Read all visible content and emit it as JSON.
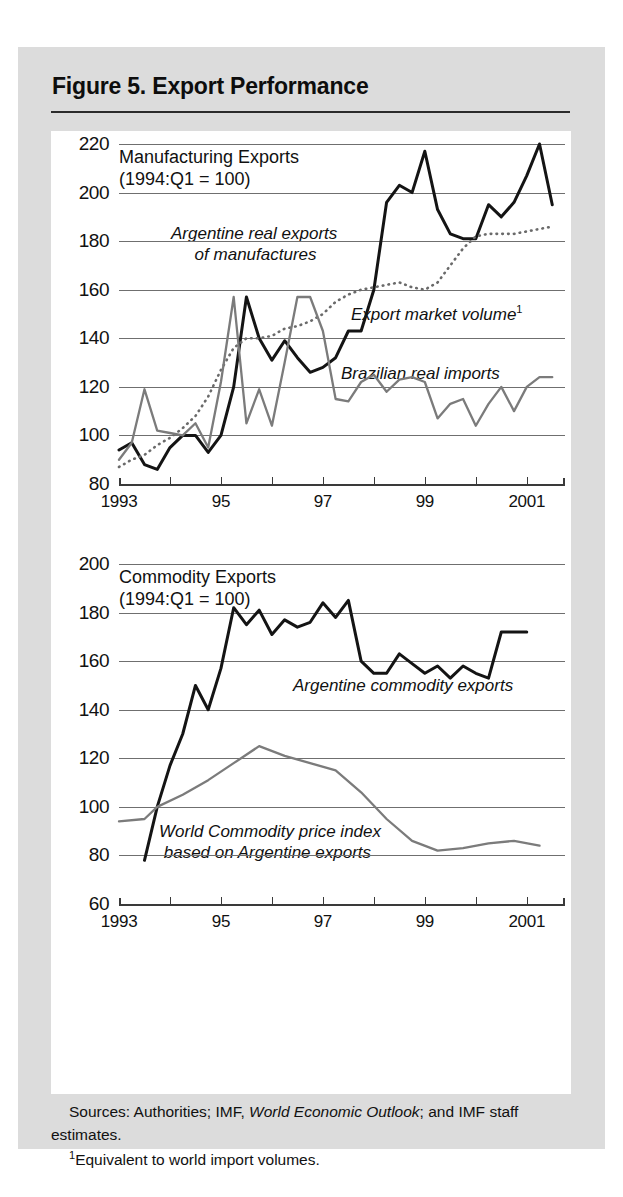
{
  "figure": {
    "title": "Figure 5. Export Performance",
    "notes": {
      "sources_prefix": "Sources: Authorities; IMF, ",
      "sources_italic": "World Economic Outlook",
      "sources_suffix": "; and IMF staff estimates.",
      "footnote_marker": "1",
      "footnote_text": "Equivalent to world import volumes."
    }
  },
  "chart_data": [
    {
      "id": "manufacturing",
      "type": "line",
      "title": "Manufacturing Exports",
      "subtitle": "(1994:Q1 = 100)",
      "xlabel": "",
      "ylabel": "",
      "ylim": [
        80,
        220
      ],
      "yticks": [
        80,
        100,
        120,
        140,
        160,
        180,
        200,
        220
      ],
      "grid": true,
      "xlim": [
        1993.0,
        2001.75
      ],
      "xticks": [
        1993,
        1994,
        1995,
        1996,
        1997,
        1998,
        1999,
        2000,
        2001
      ],
      "xticklabels": [
        "1993",
        "",
        "95",
        "",
        "97",
        "",
        "99",
        "",
        "2001"
      ],
      "legend_position": "inline-annotations",
      "series": [
        {
          "name": "Argentine real exports of manufactures",
          "style": "solid-black",
          "color": "#141414",
          "label_x": 1994.05,
          "label_y": 186,
          "x": [
            1993.0,
            1993.25,
            1993.5,
            1993.75,
            1994.0,
            1994.25,
            1994.5,
            1994.75,
            1995.0,
            1995.25,
            1995.5,
            1995.75,
            1996.0,
            1996.25,
            1996.5,
            1996.75,
            1997.0,
            1997.25,
            1997.5,
            1997.75,
            1998.0,
            1998.25,
            1998.5,
            1998.75,
            1999.0,
            1999.25,
            1999.5,
            1999.75,
            2000.0,
            2000.25,
            2000.5,
            2000.75,
            2001.0,
            2001.25,
            2001.5
          ],
          "y": [
            94,
            97,
            88,
            86,
            95,
            100,
            100,
            93,
            100,
            120,
            157,
            140,
            131,
            139,
            132,
            126,
            128,
            132,
            143,
            143,
            160,
            196,
            203,
            200,
            217,
            193,
            183,
            181,
            181,
            195,
            190,
            196,
            207,
            220,
            195
          ]
        },
        {
          "name": "Export market volume",
          "style": "dotted-gray",
          "color": "#6a6a6a",
          "label_x": 1997.35,
          "label_y": 150,
          "footnote_marker": "1",
          "x": [
            1993.0,
            1993.25,
            1993.5,
            1993.75,
            1994.0,
            1994.25,
            1994.5,
            1994.75,
            1995.0,
            1995.25,
            1995.5,
            1995.75,
            1996.0,
            1996.25,
            1996.5,
            1996.75,
            1997.0,
            1997.25,
            1997.5,
            1997.75,
            1998.0,
            1998.25,
            1998.5,
            1998.75,
            1999.0,
            1999.25,
            1999.5,
            1999.75,
            2000.0,
            2000.25,
            2000.5,
            2000.75,
            2001.0,
            2001.25,
            2001.5
          ],
          "y": [
            87,
            90,
            92,
            96,
            99,
            103,
            108,
            116,
            127,
            136,
            140,
            140,
            141,
            144,
            145,
            147,
            150,
            155,
            158,
            160,
            161,
            162,
            163,
            161,
            160,
            163,
            170,
            177,
            182,
            183,
            183,
            183,
            184,
            185,
            186
          ]
        },
        {
          "name": "Brazilian real imports",
          "style": "solid-gray",
          "color": "#7b7b7b",
          "label_x": 1997.5,
          "label_y": 131,
          "x": [
            1993.0,
            1993.25,
            1993.5,
            1993.75,
            1994.0,
            1994.25,
            1994.5,
            1994.75,
            1995.0,
            1995.25,
            1995.5,
            1995.75,
            1996.0,
            1996.25,
            1996.5,
            1996.75,
            1997.0,
            1997.25,
            1997.5,
            1997.75,
            1998.0,
            1998.25,
            1998.5,
            1998.75,
            1999.0,
            1999.25,
            1999.5,
            1999.75,
            2000.0,
            2000.25,
            2000.5,
            2000.75,
            2001.0,
            2001.25,
            2001.5
          ],
          "y": [
            90,
            97,
            119,
            102,
            101,
            100,
            105,
            95,
            122,
            157,
            105,
            119,
            104,
            130,
            157,
            157,
            143,
            115,
            114,
            122,
            125,
            118,
            123,
            124,
            122,
            107,
            113,
            115,
            104,
            113,
            120,
            110,
            120,
            124,
            124
          ]
        }
      ]
    },
    {
      "id": "commodity",
      "type": "line",
      "title": "Commodity Exports",
      "subtitle": "(1994:Q1 = 100)",
      "xlabel": "",
      "ylabel": "",
      "ylim": [
        60,
        200
      ],
      "yticks": [
        60,
        80,
        100,
        120,
        140,
        160,
        180,
        200
      ],
      "grid": true,
      "xlim": [
        1993.0,
        2001.75
      ],
      "xticks": [
        1993,
        1994,
        1995,
        1996,
        1997,
        1998,
        1999,
        2000,
        2001
      ],
      "xticklabels": [
        "1993",
        "",
        "95",
        "",
        "97",
        "",
        "99",
        "",
        "2001"
      ],
      "legend_position": "inline-annotations",
      "series": [
        {
          "name": "Argentine commodity exports",
          "style": "solid-black",
          "color": "#141414",
          "label_x": 1996.6,
          "label_y": 145,
          "x": [
            1993.5,
            1993.75,
            1994.0,
            1994.25,
            1994.5,
            1994.75,
            1995.0,
            1995.25,
            1995.5,
            1995.75,
            1996.0,
            1996.25,
            1996.5,
            1996.75,
            1997.0,
            1997.25,
            1997.5,
            1997.75,
            1998.0,
            1998.25,
            1998.5,
            1998.75,
            1999.0,
            1999.25,
            1999.5,
            1999.75,
            2000.0,
            2000.25,
            2000.5,
            2000.75,
            2001.0
          ],
          "y": [
            78,
            100,
            117,
            130,
            150,
            140,
            157,
            182,
            175,
            181,
            171,
            177,
            174,
            176,
            184,
            178,
            185,
            160,
            155,
            155,
            163,
            159,
            155,
            158,
            153,
            158,
            155,
            153,
            172,
            172,
            172
          ]
        },
        {
          "name": "World Commodity price index based on Argentine exports",
          "style": "solid-gray",
          "color": "#7b7b7b",
          "label_x": 1993.85,
          "label_y": 87,
          "x": [
            1993.0,
            1993.5,
            1993.75,
            1994.25,
            1994.75,
            1995.25,
            1995.75,
            1996.25,
            1996.75,
            1997.25,
            1997.75,
            1998.25,
            1998.75,
            1999.25,
            1999.75,
            2000.25,
            2000.75,
            2001.25
          ],
          "y": [
            94,
            95,
            100,
            105,
            111,
            118,
            125,
            121,
            118,
            115,
            106,
            95,
            86,
            82,
            83,
            85,
            86,
            84
          ]
        }
      ]
    }
  ]
}
